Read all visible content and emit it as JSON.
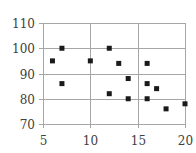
{
  "chart_data": {
    "type": "scatter",
    "title": "",
    "xlabel": "",
    "ylabel": "",
    "xlim": [
      5,
      20
    ],
    "ylim": [
      70,
      110
    ],
    "xticks": [
      5,
      10,
      15,
      20
    ],
    "yticks": [
      70,
      80,
      90,
      100,
      110
    ],
    "grid": true,
    "legend": null,
    "marker": "square",
    "marker_color": "#1a1a1a",
    "grid_color": "#a6a6a6",
    "series": [
      {
        "name": "Series 1",
        "points": [
          {
            "x": 6,
            "y": 95
          },
          {
            "x": 7,
            "y": 100
          },
          {
            "x": 7,
            "y": 86
          },
          {
            "x": 10,
            "y": 95
          },
          {
            "x": 12,
            "y": 100
          },
          {
            "x": 12,
            "y": 82
          },
          {
            "x": 13,
            "y": 94
          },
          {
            "x": 14,
            "y": 88
          },
          {
            "x": 14,
            "y": 80
          },
          {
            "x": 16,
            "y": 94
          },
          {
            "x": 16,
            "y": 86
          },
          {
            "x": 16,
            "y": 80
          },
          {
            "x": 17,
            "y": 84
          },
          {
            "x": 18,
            "y": 76
          },
          {
            "x": 20,
            "y": 78
          }
        ]
      }
    ]
  }
}
